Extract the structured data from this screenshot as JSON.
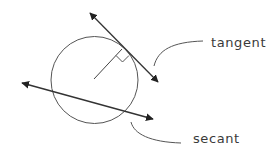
{
  "diagram": {
    "labels": {
      "tangent": "tangent",
      "secant": "secant"
    },
    "colors": {
      "stroke": "#444444",
      "arrow": "#222222",
      "leader": "#555555",
      "text": "#3a3a3a",
      "background": "#ffffff"
    },
    "circle": {
      "cx": 94.5,
      "cy": 80,
      "r": 43.5
    },
    "tangent_line": {
      "x1": 88,
      "y1": 11,
      "x2": 160,
      "y2": 84
    },
    "secant_line": {
      "x1": 20,
      "y1": 82,
      "x2": 155,
      "y2": 120
    },
    "radius": {
      "x1": 94,
      "y1": 79,
      "x2": 122,
      "y2": 49
    },
    "right_angle_marker": true
  }
}
